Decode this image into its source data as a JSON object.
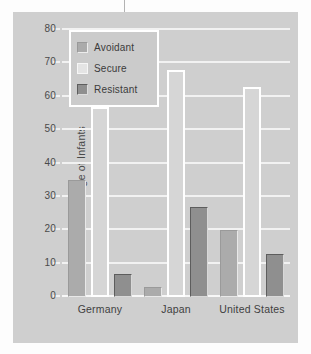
{
  "chart_data": {
    "type": "bar",
    "title": "",
    "xlabel": "",
    "ylabel": "Percentage of Infants",
    "categories": [
      "Germany",
      "Japan",
      "United States"
    ],
    "series": [
      {
        "name": "Avoidant",
        "values": [
          35,
          3,
          20
        ],
        "color": "#ababab"
      },
      {
        "name": "Secure",
        "values": [
          57,
          68,
          63
        ],
        "color": "#ffffff"
      },
      {
        "name": "Resistant",
        "values": [
          7,
          27,
          13
        ],
        "color": "#8f8f8f"
      }
    ],
    "ylim": [
      0,
      80
    ],
    "yticks": [
      0,
      10,
      20,
      30,
      40,
      50,
      60,
      70,
      80
    ],
    "ytick_labels": [
      "0",
      "10",
      "20",
      "30",
      "40",
      "50",
      "60",
      "70",
      "80"
    ],
    "grid": true,
    "legend_position": "upper-left-inside"
  },
  "axis": {
    "y_title": "Percentage of Infants",
    "ticks": [
      {
        "value": 80,
        "label": "80"
      },
      {
        "value": 70,
        "label": "70"
      },
      {
        "value": 60,
        "label": "60"
      },
      {
        "value": 50,
        "label": "50"
      },
      {
        "value": 40,
        "label": "40"
      },
      {
        "value": 30,
        "label": "30"
      },
      {
        "value": 20,
        "label": "20"
      },
      {
        "value": 10,
        "label": "10"
      },
      {
        "value": 0,
        "label": "0"
      }
    ]
  },
  "legend": {
    "items": [
      {
        "label": "Avoidant",
        "swatch": "avoidant"
      },
      {
        "label": "Secure",
        "swatch": "secure"
      },
      {
        "label": "Resistant",
        "swatch": "resistant"
      }
    ]
  },
  "groups": [
    {
      "label": "Germany",
      "bars": [
        {
          "series": "Avoidant",
          "value": 35
        },
        {
          "series": "Secure",
          "value": 57
        },
        {
          "series": "Resistant",
          "value": 7
        }
      ]
    },
    {
      "label": "Japan",
      "bars": [
        {
          "series": "Avoidant",
          "value": 3
        },
        {
          "series": "Secure",
          "value": 68
        },
        {
          "series": "Resistant",
          "value": 27
        }
      ]
    },
    {
      "label": "United States",
      "bars": [
        {
          "series": "Avoidant",
          "value": 20
        },
        {
          "series": "Secure",
          "value": 63
        },
        {
          "series": "Resistant",
          "value": 13
        }
      ]
    }
  ]
}
